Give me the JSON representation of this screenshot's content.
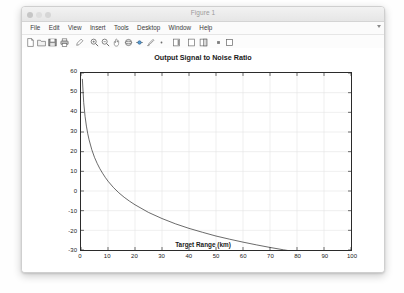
{
  "window": {
    "title": "Figure 1",
    "traffic_lights": [
      "close",
      "minimize",
      "maximize"
    ]
  },
  "menubar": {
    "items": [
      {
        "label": "File"
      },
      {
        "label": "Edit"
      },
      {
        "label": "View"
      },
      {
        "label": "Insert"
      },
      {
        "label": "Tools"
      },
      {
        "label": "Desktop"
      },
      {
        "label": "Window"
      },
      {
        "label": "Help"
      }
    ],
    "overflow_icon": "chevron-down-icon"
  },
  "toolbar": {
    "buttons": [
      {
        "name": "new-figure-icon",
        "tooltip": "New Figure"
      },
      {
        "name": "open-file-icon",
        "tooltip": "Open File"
      },
      {
        "name": "save-figure-icon",
        "tooltip": "Save Figure"
      },
      {
        "name": "print-figure-icon",
        "tooltip": "Print Figure"
      },
      {
        "name": "edit-plot-icon",
        "tooltip": "Edit Plot"
      },
      {
        "name": "zoom-in-icon",
        "tooltip": "Zoom In"
      },
      {
        "name": "zoom-out-icon",
        "tooltip": "Zoom Out"
      },
      {
        "name": "pan-icon",
        "tooltip": "Pan"
      },
      {
        "name": "rotate-3d-icon",
        "tooltip": "Rotate 3D"
      },
      {
        "name": "data-cursor-icon",
        "tooltip": "Data Cursor"
      },
      {
        "name": "brush-icon",
        "tooltip": "Brush/Select Data"
      },
      {
        "name": "link-data-icon",
        "tooltip": "Link Plot"
      },
      {
        "name": "colorbar-icon",
        "tooltip": "Insert Colorbar"
      },
      {
        "name": "legend-icon",
        "tooltip": "Insert Legend"
      },
      {
        "name": "plot-browser-icon",
        "tooltip": "Show Plot Tools"
      },
      {
        "name": "hide-plot-tools-icon",
        "tooltip": "Hide Plot Tools"
      }
    ]
  },
  "chart_data": {
    "type": "line",
    "title": "Output Signal to Noise Ratio",
    "xlabel": "Target Range (km)",
    "ylabel": "Output Signal to Noise Ratio (dB)",
    "xlim": [
      0,
      100
    ],
    "ylim": [
      -30,
      60
    ],
    "xticks": [
      0,
      10,
      20,
      30,
      40,
      50,
      60,
      70,
      80,
      90,
      100
    ],
    "yticks": [
      -30,
      -20,
      -10,
      0,
      10,
      20,
      30,
      40,
      50,
      60
    ],
    "grid": true,
    "legend": null,
    "line_color": "#2b2b2b",
    "line_width": 0.7,
    "series": [
      {
        "name": "Output SNR",
        "x": [
          0.5,
          1,
          1.5,
          2,
          2.5,
          3,
          4,
          5,
          6,
          7,
          8,
          9,
          10,
          12,
          14,
          16,
          18,
          20,
          25,
          30,
          35,
          40,
          45,
          50,
          55,
          60,
          65,
          70,
          75,
          80,
          85,
          90,
          95,
          100
        ],
        "y": [
          57.0,
          45.0,
          38.0,
          33.0,
          29.1,
          26.0,
          21.0,
          17.1,
          14.0,
          11.3,
          9.0,
          6.9,
          5.0,
          1.8,
          -0.9,
          -3.2,
          -5.2,
          -7.0,
          -10.9,
          -14.0,
          -16.7,
          -19.0,
          -21.0,
          -22.9,
          -24.5,
          -26.0,
          -27.4,
          -28.7,
          -29.9,
          -31.0,
          -32.1,
          -33.1,
          -34.0,
          -34.9
        ],
        "description": "Radar output SNR decreasing with target range following the R^-4 range law"
      }
    ]
  }
}
